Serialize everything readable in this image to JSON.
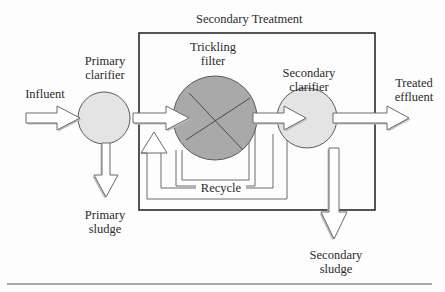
{
  "diagram": {
    "title": "Secondary Treatment",
    "colors": {
      "clarifier_fill": "#e4e4e4",
      "filter_fill": "#a9a9a9",
      "stroke": "#555555",
      "box_stroke": "#2a2a2a",
      "arrow_fill": "#ffffff",
      "arrow_shadow": "#bdbdbd"
    },
    "nodes": [
      {
        "id": "primary_clarifier",
        "label_line1": "Primary",
        "label_line2": "clarifier",
        "shape": "circle"
      },
      {
        "id": "trickling_filter",
        "label_line1": "Trickling",
        "label_line2": "filter",
        "shape": "circle-with-x"
      },
      {
        "id": "secondary_clarifier",
        "label_line1": "Secondary",
        "label_line2": "clarifier",
        "shape": "circle"
      }
    ],
    "flows": {
      "influent": "Influent",
      "treated_effluent_line1": "Treated",
      "treated_effluent_line2": "effluent",
      "primary_sludge_line1": "Primary",
      "primary_sludge_line2": "sludge",
      "secondary_sludge_line1": "Secondary",
      "secondary_sludge_line2": "sludge",
      "recycle": "Recycle"
    },
    "edges": [
      {
        "from": "Influent",
        "to": "Primary clarifier"
      },
      {
        "from": "Primary clarifier",
        "to": "Trickling filter"
      },
      {
        "from": "Primary clarifier",
        "to": "Primary sludge"
      },
      {
        "from": "Trickling filter",
        "to": "Secondary clarifier"
      },
      {
        "from": "Trickling filter",
        "to": "Trickling filter inlet",
        "label": "Recycle"
      },
      {
        "from": "Secondary clarifier",
        "to": "Trickling filter inlet",
        "label": "Recycle"
      },
      {
        "from": "Secondary clarifier",
        "to": "Treated effluent"
      },
      {
        "from": "Secondary clarifier",
        "to": "Secondary sludge"
      }
    ]
  }
}
